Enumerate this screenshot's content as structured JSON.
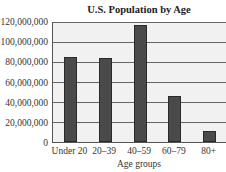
{
  "chart_data": {
    "type": "bar",
    "title": "U.S. Population by Age",
    "xlabel": "Age groups",
    "ylabel": "",
    "categories": [
      "Under 20",
      "20–39",
      "40–59",
      "60–79",
      "80+"
    ],
    "values": [
      84000000,
      83000000,
      116000000,
      46000000,
      11000000
    ],
    "ylim": [
      0,
      120000000
    ],
    "yticks": [
      0,
      20000000,
      40000000,
      60000000,
      80000000,
      100000000,
      120000000
    ],
    "ytick_labels": [
      "0",
      "20,000,000",
      "40,000,000",
      "60,000,000",
      "80,000,000",
      "100,000,000",
      "120,000,000"
    ],
    "grid": true,
    "legend": null,
    "bar_color": "#4a4a4a",
    "background_color": "#f1f1f1"
  }
}
